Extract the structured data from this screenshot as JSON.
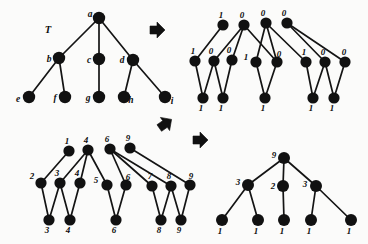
{
  "figure": {
    "background_color": "#fbfbfa",
    "node_color": "#111111",
    "edge_color": "#141414"
  },
  "panels": {
    "top_left": {
      "name": "T",
      "caption": "T",
      "node_labels": [
        "a",
        "b",
        "c",
        "d",
        "e",
        "f",
        "g",
        "h",
        "i"
      ]
    },
    "top_right": {
      "name": "binary-labeled-forest",
      "node_labels": [
        "1",
        "0",
        "0",
        "0",
        "1",
        "0",
        "0",
        "1",
        "0",
        "1",
        "0",
        "0",
        "1",
        "1",
        "1",
        "1",
        "1"
      ]
    },
    "bottom_left": {
      "name": "numeric-labeled-forest",
      "node_labels": [
        "1",
        "4",
        "6",
        "9",
        "2",
        "3",
        "4",
        "5",
        "6",
        "7",
        "8",
        "9",
        "3",
        "4",
        "6",
        "8",
        "9"
      ]
    },
    "bottom_right": {
      "name": "reduced-tree",
      "node_labels": [
        "9",
        "3",
        "2",
        "3",
        "1",
        "1",
        "1",
        "1",
        "1"
      ]
    }
  },
  "arrows": [
    {
      "name": "transform-arrow-top",
      "glyph": "right-arrow-outline"
    },
    {
      "name": "transform-arrow-middle-left",
      "glyph": "up-left-arrow-outline"
    },
    {
      "name": "transform-arrow-bottom",
      "glyph": "right-arrow-outline"
    }
  ],
  "graph_data": {
    "top_left": {
      "nodes": [
        {
          "id": "a",
          "x": 99,
          "y": 18,
          "label": "a",
          "label_dx": -9,
          "label_dy": -3
        },
        {
          "id": "b",
          "x": 59,
          "y": 58,
          "label": "b",
          "label_dx": -10,
          "label_dy": 2
        },
        {
          "id": "c",
          "x": 99,
          "y": 59,
          "label": "c",
          "label_dx": -10,
          "label_dy": 2
        },
        {
          "id": "d",
          "x": 133,
          "y": 60,
          "label": "d",
          "label_dx": -11,
          "label_dy": 1
        },
        {
          "id": "e",
          "x": 29,
          "y": 97,
          "label": "e",
          "label_dx": -11,
          "label_dy": 3
        },
        {
          "id": "f",
          "x": 65,
          "y": 97,
          "label": "f",
          "label_dx": -10,
          "label_dy": 2
        },
        {
          "id": "g",
          "x": 99,
          "y": 97,
          "label": "g",
          "label_dx": -11,
          "label_dy": 2
        },
        {
          "id": "h",
          "x": 124,
          "y": 97,
          "label": "h",
          "label_dx": 7,
          "label_dy": 4
        },
        {
          "id": "i",
          "x": 165,
          "y": 97,
          "label": "i",
          "label_dx": 7,
          "label_dy": 5
        }
      ],
      "edges": [
        [
          "a",
          "b"
        ],
        [
          "a",
          "c"
        ],
        [
          "a",
          "d"
        ],
        [
          "b",
          "e"
        ],
        [
          "b",
          "f"
        ],
        [
          "c",
          "g"
        ],
        [
          "d",
          "h"
        ],
        [
          "d",
          "i"
        ]
      ]
    },
    "top_right": {
      "nodes": [
        {
          "id": "r1",
          "x": 223,
          "y": 25,
          "label": "1",
          "label_dx": -2,
          "label_dy": -9
        },
        {
          "id": "r2",
          "x": 244,
          "y": 25,
          "label": "0",
          "label_dx": -2,
          "label_dy": -9
        },
        {
          "id": "r3",
          "x": 266,
          "y": 23,
          "label": "0",
          "label_dx": -3,
          "label_dy": -9
        },
        {
          "id": "r4",
          "x": 287,
          "y": 23,
          "label": "0",
          "label_dx": -3,
          "label_dy": -9
        },
        {
          "id": "m1",
          "x": 195,
          "y": 61,
          "label": "1",
          "label_dx": -2,
          "label_dy": -9
        },
        {
          "id": "m2",
          "x": 214,
          "y": 61,
          "label": "0",
          "label_dx": -3,
          "label_dy": -9
        },
        {
          "id": "m3",
          "x": 232,
          "y": 60,
          "label": "0",
          "label_dx": -3,
          "label_dy": -9
        },
        {
          "id": "m4",
          "x": 256,
          "y": 62,
          "label": "1",
          "label_dx": -10,
          "label_dy": -4
        },
        {
          "id": "m5",
          "x": 277,
          "y": 62,
          "label": "0",
          "label_dx": 2,
          "label_dy": -7
        },
        {
          "id": "m6",
          "x": 306,
          "y": 62,
          "label": "1",
          "label_dx": -2,
          "label_dy": -9
        },
        {
          "id": "m7",
          "x": 325,
          "y": 62,
          "label": "0",
          "label_dx": -2,
          "label_dy": -9
        },
        {
          "id": "m8",
          "x": 345,
          "y": 62,
          "label": "0",
          "label_dx": -1,
          "label_dy": -9
        },
        {
          "id": "b1",
          "x": 203,
          "y": 98,
          "label": "1",
          "label_dx": -2,
          "label_dy": 11
        },
        {
          "id": "b2",
          "x": 223,
          "y": 98,
          "label": "1",
          "label_dx": -2,
          "label_dy": 11
        },
        {
          "id": "b3",
          "x": 265,
          "y": 98,
          "label": "1",
          "label_dx": -2,
          "label_dy": 11
        },
        {
          "id": "b4",
          "x": 313,
          "y": 98,
          "label": "1",
          "label_dx": -2,
          "label_dy": 11
        },
        {
          "id": "b5",
          "x": 334,
          "y": 98,
          "label": "1",
          "label_dx": -2,
          "label_dy": 11
        }
      ],
      "edges": [
        [
          "r1",
          "m1"
        ],
        [
          "r2",
          "m2"
        ],
        [
          "r2",
          "m3"
        ],
        [
          "r2",
          "m5"
        ],
        [
          "r3",
          "m4"
        ],
        [
          "r3",
          "m5"
        ],
        [
          "r3",
          "m6"
        ],
        [
          "r4",
          "m7"
        ],
        [
          "r4",
          "m8"
        ],
        [
          "m1",
          "b1"
        ],
        [
          "m2",
          "b1"
        ],
        [
          "m2",
          "b2"
        ],
        [
          "m3",
          "b2"
        ],
        [
          "m4",
          "b3"
        ],
        [
          "m5",
          "b3"
        ],
        [
          "m6",
          "b4"
        ],
        [
          "m7",
          "b4"
        ],
        [
          "m7",
          "b5"
        ],
        [
          "m8",
          "b5"
        ]
      ]
    },
    "bottom_left": {
      "nodes": [
        {
          "id": "R1",
          "x": 69,
          "y": 151,
          "label": "1",
          "label_dx": -2,
          "label_dy": -9
        },
        {
          "id": "R2",
          "x": 88,
          "y": 150,
          "label": "4",
          "label_dx": -2,
          "label_dy": -9
        },
        {
          "id": "R3",
          "x": 110,
          "y": 149,
          "label": "6",
          "label_dx": -3,
          "label_dy": -9
        },
        {
          "id": "R4",
          "x": 130,
          "y": 148,
          "label": "9",
          "label_dx": -2,
          "label_dy": -9
        },
        {
          "id": "M1",
          "x": 41,
          "y": 183,
          "label": "2",
          "label_dx": -9,
          "label_dy": -6
        },
        {
          "id": "M2",
          "x": 60,
          "y": 183,
          "label": "3",
          "label_dx": -3,
          "label_dy": -9
        },
        {
          "id": "M3",
          "x": 80,
          "y": 183,
          "label": "4",
          "label_dx": -3,
          "label_dy": -9
        },
        {
          "id": "M4",
          "x": 107,
          "y": 185,
          "label": "5",
          "label_dx": -11,
          "label_dy": -4
        },
        {
          "id": "M5",
          "x": 126,
          "y": 185,
          "label": "6",
          "label_dx": 2,
          "label_dy": -7
        },
        {
          "id": "M6",
          "x": 152,
          "y": 186,
          "label": "7",
          "label_dx": -2,
          "label_dy": -9
        },
        {
          "id": "M7",
          "x": 171,
          "y": 186,
          "label": "8",
          "label_dx": -2,
          "label_dy": -9
        },
        {
          "id": "M8",
          "x": 190,
          "y": 185,
          "label": "9",
          "label_dx": 1,
          "label_dy": -8
        },
        {
          "id": "B1",
          "x": 49,
          "y": 220,
          "label": "3",
          "label_dx": -2,
          "label_dy": 11
        },
        {
          "id": "B2",
          "x": 70,
          "y": 220,
          "label": "4",
          "label_dx": -2,
          "label_dy": 11
        },
        {
          "id": "B3",
          "x": 116,
          "y": 220,
          "label": "6",
          "label_dx": -2,
          "label_dy": 11
        },
        {
          "id": "B4",
          "x": 161,
          "y": 220,
          "label": "8",
          "label_dx": -2,
          "label_dy": 11
        },
        {
          "id": "B5",
          "x": 181,
          "y": 220,
          "label": "9",
          "label_dx": -2,
          "label_dy": 11
        }
      ],
      "edges": [
        [
          "R1",
          "M1"
        ],
        [
          "R2",
          "M2"
        ],
        [
          "R2",
          "M3"
        ],
        [
          "R2",
          "M4"
        ],
        [
          "R3",
          "M5"
        ],
        [
          "R3",
          "M6"
        ],
        [
          "R4",
          "M8"
        ],
        [
          "R3",
          "M7"
        ],
        [
          "M1",
          "B1"
        ],
        [
          "M2",
          "B1"
        ],
        [
          "M2",
          "B2"
        ],
        [
          "M3",
          "B2"
        ],
        [
          "M4",
          "B3"
        ],
        [
          "M5",
          "B3"
        ],
        [
          "M6",
          "B4"
        ],
        [
          "M7",
          "B4"
        ],
        [
          "M7",
          "B5"
        ],
        [
          "M8",
          "B5"
        ]
      ]
    },
    "bottom_right": {
      "nodes": [
        {
          "id": "t",
          "x": 284,
          "y": 158,
          "label": "9",
          "label_dx": -10,
          "label_dy": -2
        },
        {
          "id": "c1",
          "x": 248,
          "y": 185,
          "label": "3",
          "label_dx": -10,
          "label_dy": -2
        },
        {
          "id": "c2",
          "x": 283,
          "y": 186,
          "label": "2",
          "label_dx": -10,
          "label_dy": 1
        },
        {
          "id": "c3",
          "x": 316,
          "y": 186,
          "label": "3",
          "label_dx": -11,
          "label_dy": -1
        },
        {
          "id": "l1",
          "x": 222,
          "y": 220,
          "label": "1",
          "label_dx": -2,
          "label_dy": 12
        },
        {
          "id": "l2",
          "x": 258,
          "y": 220,
          "label": "1",
          "label_dx": -2,
          "label_dy": 12
        },
        {
          "id": "l3",
          "x": 284,
          "y": 220,
          "label": "1",
          "label_dx": -2,
          "label_dy": 12
        },
        {
          "id": "l4",
          "x": 311,
          "y": 220,
          "label": "1",
          "label_dx": -2,
          "label_dy": 12
        },
        {
          "id": "l5",
          "x": 351,
          "y": 220,
          "label": "1",
          "label_dx": -2,
          "label_dy": 12
        }
      ],
      "edges": [
        [
          "t",
          "c1"
        ],
        [
          "t",
          "c2"
        ],
        [
          "t",
          "c3"
        ],
        [
          "c1",
          "l1"
        ],
        [
          "c1",
          "l2"
        ],
        [
          "c2",
          "l3"
        ],
        [
          "c3",
          "l4"
        ],
        [
          "c3",
          "l5"
        ]
      ]
    }
  },
  "tree_caption": {
    "label": "T",
    "x": 48,
    "y": 31
  },
  "arrow_positions": [
    {
      "name": "transform-arrow-top",
      "x": 157,
      "y": 30,
      "scale": 1.0,
      "rotation": 0
    },
    {
      "name": "transform-arrow-middle-left",
      "x": 165,
      "y": 124,
      "scale": 1.0,
      "rotation": -35
    },
    {
      "name": "transform-arrow-bottom",
      "x": 200,
      "y": 140,
      "scale": 1.0,
      "rotation": 0
    }
  ]
}
